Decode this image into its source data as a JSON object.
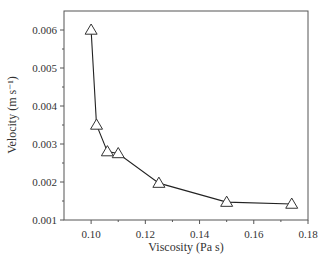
{
  "chart_data": {
    "type": "line",
    "title": "",
    "xlabel": "Viscosity (Pa s)",
    "ylabel": "Velocity (m s⁻¹)",
    "xlim": [
      0.09,
      0.18
    ],
    "ylim": [
      0.001,
      0.0065
    ],
    "grid": false,
    "legend": null,
    "marker": "open-triangle",
    "x_ticks": [
      "0.10",
      "0.12",
      "0.14",
      "0.16",
      "0.18"
    ],
    "y_ticks": [
      "0.001",
      "0.002",
      "0.003",
      "0.004",
      "0.005",
      "0.006"
    ],
    "series": [
      {
        "name": "Velocity",
        "x": [
          0.1,
          0.102,
          0.106,
          0.11,
          0.125,
          0.15,
          0.174
        ],
        "y": [
          0.006,
          0.0035,
          0.0028,
          0.00275,
          0.00197,
          0.00147,
          0.00142
        ]
      }
    ]
  }
}
